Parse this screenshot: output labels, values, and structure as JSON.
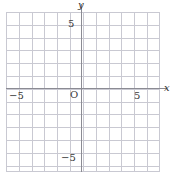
{
  "chart_data": {
    "type": "scatter",
    "title": "",
    "xlabel": "x",
    "ylabel": "y",
    "xlim": [
      -6,
      6
    ],
    "ylim": [
      -6,
      6.5
    ],
    "grid": true,
    "legend": null,
    "series": [],
    "x_tick_labels": [
      "-5",
      "5"
    ],
    "y_tick_labels": [
      "5",
      "-5"
    ],
    "origin_label": "O",
    "grid_step": 1,
    "grid_columns": 12,
    "grid_rows": 12,
    "colors": {
      "background": "#ffffff",
      "gridline": "#c9c9d2",
      "axis": "#8b8b93",
      "label_text": "#3a3a3a"
    }
  },
  "axes": {
    "y_name": "y",
    "x_name": "x"
  },
  "ticks": {
    "x_negative_five": "−5",
    "x_positive_five": "5",
    "y_positive_five": "5",
    "y_negative_five": "−5",
    "origin": "O"
  }
}
